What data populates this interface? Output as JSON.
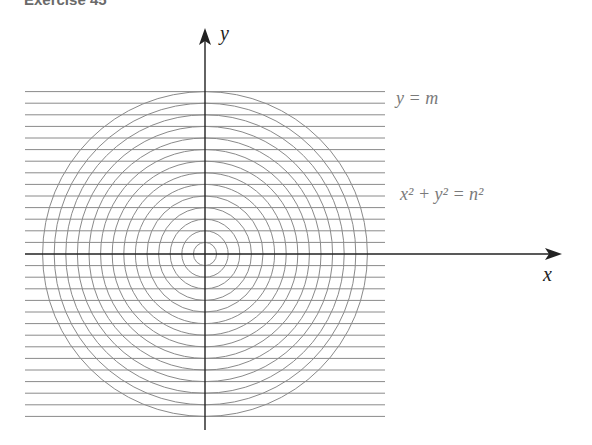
{
  "header": {
    "title": "Exercise 45"
  },
  "diagram": {
    "x_axis_label": "x",
    "y_axis_label": "y",
    "line_family_label": "y = m",
    "circle_family_label": "x² + y² = n²",
    "center": [
      205,
      254
    ],
    "spacing": 11.6,
    "num_lines_each_side": 14,
    "num_circles": 14,
    "line_x_start": 25,
    "line_x_end": 385,
    "colors": {
      "axis": "#222222",
      "curves": "#8a8a8a",
      "labels": "#7a7a7a"
    }
  }
}
